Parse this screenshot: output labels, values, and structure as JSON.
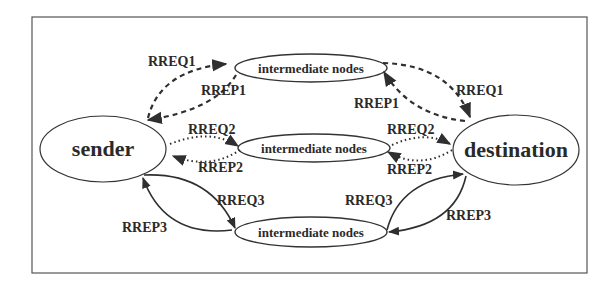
{
  "diagram": {
    "type": "network-routing-flow",
    "colors": {
      "stroke": "#2f2f2f",
      "text": "#2a2a2a",
      "background": "#ffffff",
      "frame": "#555555"
    },
    "nodes": {
      "sender": {
        "label": "sender"
      },
      "destination": {
        "label": "destination"
      },
      "intermediate_top": {
        "label": "intermediate nodes"
      },
      "intermediate_middle": {
        "label": "intermediate nodes"
      },
      "intermediate_bottom": {
        "label": "intermediate nodes"
      }
    },
    "edges": {
      "rreq1_left": {
        "label": "RREQ1",
        "from": "sender",
        "to": "intermediate_top",
        "style": "dashed"
      },
      "rrep1_left": {
        "label": "RREP1",
        "from": "intermediate_top",
        "to": "sender",
        "style": "dashed"
      },
      "rreq1_right": {
        "label": "RREQ1",
        "from": "intermediate_top",
        "to": "destination",
        "style": "dashed"
      },
      "rrep1_right": {
        "label": "RREP1",
        "from": "destination",
        "to": "intermediate_top",
        "style": "dashed"
      },
      "rreq2_left": {
        "label": "RREQ2",
        "from": "sender",
        "to": "intermediate_middle",
        "style": "dotted"
      },
      "rrep2_left": {
        "label": "RREP2",
        "from": "intermediate_middle",
        "to": "sender",
        "style": "dotted"
      },
      "rreq2_right": {
        "label": "RREQ2",
        "from": "intermediate_middle",
        "to": "destination",
        "style": "dotted"
      },
      "rrep2_right": {
        "label": "RREP2",
        "from": "destination",
        "to": "intermediate_middle",
        "style": "dotted"
      },
      "rreq3_left": {
        "label": "RREQ3",
        "from": "sender",
        "to": "intermediate_bottom",
        "style": "solid"
      },
      "rrep3_left": {
        "label": "RREP3",
        "from": "intermediate_bottom",
        "to": "sender",
        "style": "solid"
      },
      "rreq3_right": {
        "label": "RREQ3",
        "from": "intermediate_bottom",
        "to": "destination",
        "style": "solid"
      },
      "rrep3_right": {
        "label": "RREP3",
        "from": "destination",
        "to": "intermediate_bottom",
        "style": "solid"
      }
    }
  }
}
